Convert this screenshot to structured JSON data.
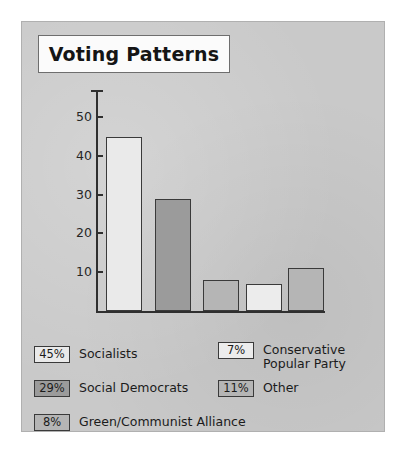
{
  "figure": {
    "panel_color": "#c9c9c9",
    "page_background": "#ffffff",
    "title": "Voting Patterns"
  },
  "chart_data": {
    "type": "bar",
    "title": "Voting Patterns",
    "xlabel": "",
    "ylabel": "",
    "ylim": [
      0,
      57
    ],
    "yticks": [
      10,
      20,
      30,
      40,
      50
    ],
    "grid": false,
    "legend_position": "below",
    "categories": [
      "Socialists",
      "Social Democrats",
      "Green/Communist Alliance",
      "Conservative Popular Party",
      "Other"
    ],
    "values": [
      45,
      29,
      8,
      7,
      11
    ],
    "value_labels": [
      "45%",
      "29%",
      "8%",
      "7%",
      "11%"
    ],
    "bar_colors": [
      "#eaeaea",
      "#9b9b9b",
      "#b5b5b5",
      "#ececec",
      "#b5b5b5"
    ],
    "bar_edge_color": "#3a3a3a"
  },
  "axis": {
    "tick_labels": [
      "50",
      "40",
      "30",
      "20",
      "10"
    ]
  },
  "legend": {
    "entries": [
      {
        "percent": "45%",
        "label": "Socialists",
        "color": "#eaeaea"
      },
      {
        "percent": "29%",
        "label": "Social Democrats",
        "color": "#9b9b9b"
      },
      {
        "percent": "8%",
        "label": "Green/Communist Alliance",
        "color": "#b5b5b5"
      },
      {
        "percent": "7%",
        "label": "Conservative\nPopular Party",
        "color": "#ececec"
      },
      {
        "percent": "11%",
        "label": "Other",
        "color": "#b5b5b5"
      }
    ]
  }
}
